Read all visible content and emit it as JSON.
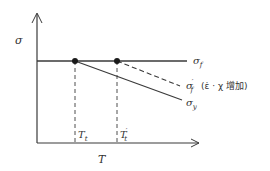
{
  "diagram": {
    "y_axis_label": "σ",
    "x_axis_label": "T",
    "curves": {
      "sigma_f": {
        "label_main": "σ",
        "label_sub": "f",
        "style": "solid"
      },
      "sigma_f_prime": {
        "label_main": "σ",
        "label_sub": "f",
        "label_prime": "′",
        "annotation": "(ε̇ · χ 增加)",
        "style": "dashed"
      },
      "sigma_y": {
        "label_main": "σ",
        "label_sub": "y",
        "style": "solid"
      }
    },
    "markers": {
      "Tt": {
        "label_main": "T",
        "label_sub": "t"
      },
      "Tt_prime": {
        "label_main": "T",
        "label_sub": "t",
        "label_prime": "′"
      }
    },
    "colors": {
      "line": "#3a3a3a",
      "background": "#ffffff"
    }
  }
}
